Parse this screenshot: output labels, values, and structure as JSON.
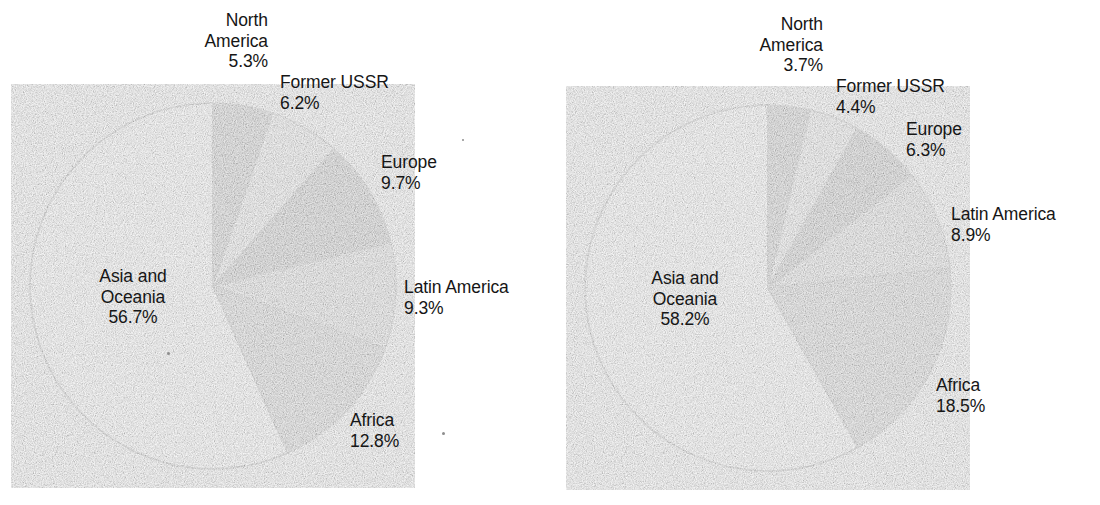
{
  "figure": {
    "background_color": "#ffffff",
    "text_color": "#161616",
    "outline_color": "#1a1a1a"
  },
  "palette": {
    "north_america": "#4b4b4b",
    "former_ussr": "#d6d6d6",
    "europe": "#111111",
    "latin_america": "#b6b6b6",
    "africa": "#8b8b8b",
    "asia_and_oceania": "#ffffff"
  },
  "chart_data": [
    {
      "type": "pie",
      "title": "",
      "id": "left-pie",
      "start_angle_deg": 0,
      "direction": "clockwise",
      "center": {
        "x": 213,
        "y": 286
      },
      "radius": 183,
      "categories": [
        "North America",
        "Former USSR",
        "Europe",
        "Latin America",
        "Africa",
        "Asia and Oceania"
      ],
      "values": [
        5.3,
        6.2,
        9.7,
        9.3,
        12.8,
        56.7
      ],
      "value_labels": [
        "5.3%",
        "6.2%",
        "9.7%",
        "9.3%",
        "12.8%",
        "56.7%"
      ],
      "colors": [
        "#4b4b4b",
        "#d6d6d6",
        "#111111",
        "#b6b6b6",
        "#8b8b8b",
        "#ffffff"
      ],
      "units": "percent",
      "legend": "none (direct labels)"
    },
    {
      "type": "pie",
      "title": "",
      "id": "right-pie",
      "start_angle_deg": 0,
      "direction": "clockwise",
      "center": {
        "x": 768,
        "y": 288
      },
      "radius": 183,
      "categories": [
        "North America",
        "Former USSR",
        "Europe",
        "Latin America",
        "Africa",
        "Asia and Oceania"
      ],
      "values": [
        3.7,
        4.4,
        6.3,
        8.9,
        18.5,
        58.2
      ],
      "value_labels": [
        "3.7%",
        "4.4%",
        "6.3%",
        "8.9%",
        "18.5%",
        "58.2%"
      ],
      "colors": [
        "#4b4b4b",
        "#d6d6d6",
        "#111111",
        "#b6b6b6",
        "#8b8b8b",
        "#ffffff"
      ],
      "units": "percent",
      "legend": "none (direct labels)"
    }
  ],
  "left_chart": {
    "labels": {
      "north_america": {
        "name": "North\nAmerica",
        "line1": "North",
        "line2": "America",
        "value": "5.3%"
      },
      "former_ussr": {
        "name": "Former USSR",
        "value": "6.2%"
      },
      "europe": {
        "name": "Europe",
        "value": "9.7%"
      },
      "latin_america": {
        "name": "Latin America",
        "value": "9.3%"
      },
      "africa": {
        "name": "Africa",
        "value": "12.8%"
      },
      "asia_and_oceania": {
        "line1": "Asia and",
        "line2": "Oceania",
        "value": "56.7%"
      }
    }
  },
  "right_chart": {
    "labels": {
      "north_america": {
        "line1": "North",
        "line2": "America",
        "value": "3.7%"
      },
      "former_ussr": {
        "name": "Former USSR",
        "value": "4.4%"
      },
      "europe": {
        "name": "Europe",
        "value": "6.3%"
      },
      "latin_america": {
        "name": "Latin America",
        "value": "8.9%"
      },
      "africa": {
        "name": "Africa",
        "value": "18.5%"
      },
      "asia_and_oceania": {
        "line1": "Asia and",
        "line2": "Oceania",
        "value": "58.2%"
      }
    }
  }
}
